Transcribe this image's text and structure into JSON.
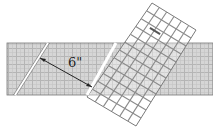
{
  "diagram": {
    "type": "fabric-cutting-illustration",
    "measurement_label": "6\"",
    "colors": {
      "fabric_fill": "#d6d6d6",
      "fabric_grid_light": "#bdbdbd",
      "fabric_grid_dark": "#a8a8a8",
      "ruler_fill": "#ffffff",
      "ruler_grid": "#8a8a8a",
      "cut_line": "#ffffff",
      "arrow": "#222222",
      "outline": "#555555"
    },
    "elements": {
      "fabric_strip": {
        "x": 7,
        "y": 43,
        "width": 206,
        "height": 52
      },
      "first_cut": {
        "x1": 48,
        "y1": 43,
        "x2": 15,
        "y2": 95
      },
      "second_cut": {
        "x1": 116,
        "y1": 43,
        "x2": 87,
        "y2": 95
      },
      "ruler": {
        "corners": [
          [
            152,
            3
          ],
          [
            196,
            30
          ],
          [
            136,
            126
          ],
          [
            87,
            97
          ]
        ],
        "rows": 12,
        "cols": 6
      },
      "arrow": {
        "x1": 40,
        "y1": 58,
        "x2": 92,
        "y2": 87
      }
    }
  }
}
